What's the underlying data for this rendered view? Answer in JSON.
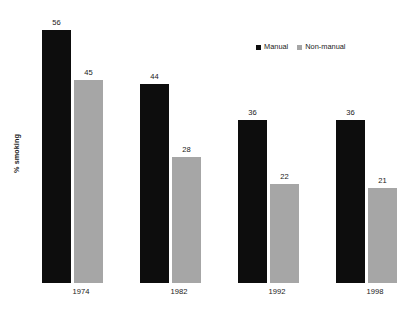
{
  "chart_data": {
    "type": "bar",
    "title": "",
    "subtitle": "",
    "xlabel": "",
    "ylabel": "% smoking",
    "categories": [
      "1974",
      "1982",
      "1992",
      "1998"
    ],
    "series": [
      {
        "name": "Manual",
        "color": "#0d0d0d",
        "values": [
          56,
          44,
          36,
          36
        ]
      },
      {
        "name": "Non-manual",
        "color": "#a6a6a6",
        "values": [
          45,
          28,
          22,
          21
        ]
      }
    ],
    "ylim": [
      0,
      60
    ],
    "grid": false,
    "axis_line": false,
    "y_ticks_visible": false,
    "data_labels": true,
    "legend_position": "top-right"
  },
  "legend": {
    "items": [
      {
        "label": "Manual",
        "color": "#0d0d0d"
      },
      {
        "label": "Non-manual",
        "color": "#a6a6a6"
      }
    ]
  },
  "axes": {
    "y_title": "% smoking",
    "x_tick_labels": [
      "1974",
      "1982",
      "1992",
      "1998"
    ]
  },
  "bar_labels": {
    "g0_s0": "56",
    "g0_s1": "45",
    "g1_s0": "44",
    "g1_s1": "28",
    "g2_s0": "36",
    "g2_s1": "22",
    "g3_s0": "36",
    "g3_s1": "21"
  }
}
